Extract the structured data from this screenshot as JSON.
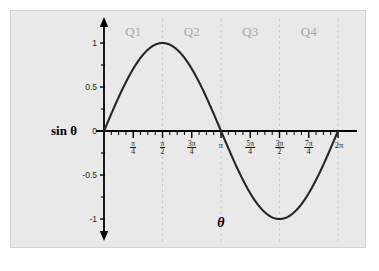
{
  "figure": {
    "title": "",
    "background_color": "#ffffff",
    "panel_color": "#e9e9e9",
    "panel_border_color": "#d2d2d2",
    "curve_color": "#262626",
    "axis_color": "#000000",
    "gridline_color": "#c9c9c9",
    "quadrant_label_color": "#a8a8a8"
  },
  "axes": {
    "y_axis_label": "sin θ",
    "x_axis_label": "θ",
    "y_ticks": [
      {
        "value": 1,
        "label": "1"
      },
      {
        "value": 0.5,
        "label": "0.5"
      },
      {
        "value": 0,
        "label": "0"
      },
      {
        "value": -0.5,
        "label": "-0.5"
      },
      {
        "value": -1,
        "label": "-1"
      }
    ],
    "x_ticks": [
      {
        "value": 0.7853981634,
        "numerator": "π",
        "denominator": "4",
        "label": "π/4"
      },
      {
        "value": 1.5707963268,
        "numerator": "π",
        "denominator": "2",
        "label": "π/2"
      },
      {
        "value": 2.3561944902,
        "numerator": "3π",
        "denominator": "4",
        "label": "3π/4"
      },
      {
        "value": 3.1415926536,
        "numerator": "",
        "denominator": "",
        "label": "π"
      },
      {
        "value": 3.926990817,
        "numerator": "5π",
        "denominator": "4",
        "label": "5π/4"
      },
      {
        "value": 4.7123889804,
        "numerator": "3π",
        "denominator": "2",
        "label": "3π/2"
      },
      {
        "value": 5.4977871438,
        "numerator": "7π",
        "denominator": "4",
        "label": "7π/4"
      },
      {
        "value": 6.2831853072,
        "numerator": "",
        "denominator": "",
        "label": "2π"
      }
    ],
    "xlim": [
      0,
      6.2831853072
    ],
    "ylim": [
      -1.18,
      1.18
    ],
    "minor_tick_count_per_quarter": 4
  },
  "quadrants": [
    {
      "name": "Q1",
      "label": "Q1",
      "start": 0,
      "end": 1.5707963268
    },
    {
      "name": "Q2",
      "label": "Q2",
      "start": 1.5707963268,
      "end": 3.1415926536
    },
    {
      "name": "Q3",
      "label": "Q3",
      "start": 3.1415926536,
      "end": 4.7123889804
    },
    {
      "name": "Q4",
      "label": "Q4",
      "start": 4.7123889804,
      "end": 6.2831853072
    }
  ],
  "gridlines": [
    {
      "at": 1.5707963268,
      "label": "π/2"
    },
    {
      "at": 3.1415926536,
      "label": "π"
    },
    {
      "at": 4.7123889804,
      "label": "3π/2"
    },
    {
      "at": 6.2831853072,
      "label": "2π"
    }
  ],
  "chart_data": {
    "type": "line",
    "title": "",
    "xlabel": "θ",
    "ylabel": "sin θ",
    "xlim": [
      0,
      6.2831853072
    ],
    "ylim": [
      -1.18,
      1.18
    ],
    "grid": true,
    "legend_position": "none",
    "series": [
      {
        "name": "sin θ",
        "color": "#262626",
        "function": "sin(theta)",
        "x": [
          0,
          0.1963,
          0.3927,
          0.589,
          0.7854,
          0.9817,
          1.1781,
          1.3744,
          1.5708,
          1.7671,
          1.9635,
          2.1598,
          2.3562,
          2.5525,
          2.7489,
          2.9452,
          3.1416,
          3.3379,
          3.5343,
          3.7306,
          3.927,
          4.1233,
          4.3197,
          4.516,
          4.7124,
          4.9087,
          5.1051,
          5.3014,
          5.4978,
          5.6941,
          5.8905,
          6.0868,
          6.2832
        ],
        "y": [
          0,
          0.1951,
          0.3827,
          0.5556,
          0.7071,
          0.8315,
          0.9239,
          0.9808,
          1.0,
          0.9808,
          0.9239,
          0.8315,
          0.7071,
          0.5556,
          0.3827,
          0.1951,
          0.0,
          -0.1951,
          -0.3827,
          -0.5556,
          -0.7071,
          -0.8315,
          -0.9239,
          -0.9808,
          -1.0,
          -0.9808,
          -0.9239,
          -0.8315,
          -0.7071,
          -0.5556,
          -0.3827,
          -0.1951,
          0.0
        ]
      }
    ],
    "annotations": [
      {
        "text": "Q1",
        "x": 0.7854,
        "y": 1.12
      },
      {
        "text": "Q2",
        "x": 2.3562,
        "y": 1.12
      },
      {
        "text": "Q3",
        "x": 3.927,
        "y": 1.12
      },
      {
        "text": "Q4",
        "x": 5.4978,
        "y": 1.12
      }
    ],
    "key_points": [
      {
        "theta": "0",
        "sin": 0
      },
      {
        "theta": "π/2",
        "sin": 1
      },
      {
        "theta": "π",
        "sin": 0
      },
      {
        "theta": "3π/2",
        "sin": -1
      },
      {
        "theta": "2π",
        "sin": 0
      }
    ]
  }
}
